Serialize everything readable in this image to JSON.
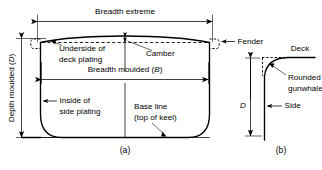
{
  "figure": {
    "captions": {
      "a": "(a)",
      "b": "(b)"
    },
    "labels": {
      "breadth_extreme": "Breadth extreme",
      "breadth_moulded": "Breadth moulded (",
      "breadth_moulded_symbol": "B",
      "breadth_moulded_close": ")",
      "depth_moulded": "Depth moulded (",
      "depth_moulded_symbol": "D",
      "depth_moulded_close": ")",
      "underside_line1": "Underside of",
      "underside_line2": "deck plating",
      "camber": "Camber",
      "fender": "Fender",
      "inside_line1": "Inside of",
      "inside_line2": "side plating",
      "baseline_line1": "Base line",
      "baseline_line2": "(top of keel)",
      "deck": "Deck",
      "rounded_line1": "Rounded",
      "rounded_line2": "gunwhale",
      "side": "Side",
      "depth_symbol_b": "D"
    },
    "colors": {
      "ink": "#000000",
      "background": "#ffffff"
    }
  }
}
